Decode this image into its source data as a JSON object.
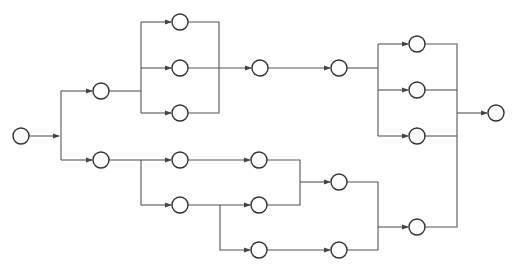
{
  "diagram": {
    "type": "network-flow",
    "colors": {
      "line": "#555555",
      "node_stroke": "#333333",
      "background": "#ffffff"
    },
    "node_radius": 8,
    "nodes": [
      {
        "id": "n0",
        "x": 21,
        "y": 136
      },
      {
        "id": "n1",
        "x": 101,
        "y": 91
      },
      {
        "id": "n2",
        "x": 101,
        "y": 160
      },
      {
        "id": "n3",
        "x": 180,
        "y": 22
      },
      {
        "id": "n4",
        "x": 180,
        "y": 68
      },
      {
        "id": "n5",
        "x": 180,
        "y": 113
      },
      {
        "id": "n6",
        "x": 260,
        "y": 68
      },
      {
        "id": "n7",
        "x": 339,
        "y": 68
      },
      {
        "id": "n8",
        "x": 417,
        "y": 44
      },
      {
        "id": "n9",
        "x": 417,
        "y": 90
      },
      {
        "id": "n10",
        "x": 417,
        "y": 136
      },
      {
        "id": "n11",
        "x": 496,
        "y": 113
      },
      {
        "id": "n12",
        "x": 180,
        "y": 160
      },
      {
        "id": "n13",
        "x": 180,
        "y": 205
      },
      {
        "id": "n14",
        "x": 259,
        "y": 160
      },
      {
        "id": "n15",
        "x": 259,
        "y": 205
      },
      {
        "id": "n16",
        "x": 259,
        "y": 250
      },
      {
        "id": "n17",
        "x": 339,
        "y": 182
      },
      {
        "id": "n18",
        "x": 339,
        "y": 250
      },
      {
        "id": "n19",
        "x": 417,
        "y": 227
      }
    ],
    "edges": [
      {
        "points": [
          [
            29,
            136
          ],
          [
            59,
            136
          ]
        ],
        "arrow": true
      },
      {
        "points": [
          [
            61,
            91
          ],
          [
            61,
            160
          ]
        ],
        "arrow": false
      },
      {
        "points": [
          [
            61,
            91
          ],
          [
            92,
            91
          ]
        ],
        "arrow": true
      },
      {
        "points": [
          [
            61,
            160
          ],
          [
            92,
            160
          ]
        ],
        "arrow": true
      },
      {
        "points": [
          [
            109,
            91
          ],
          [
            141,
            91
          ]
        ],
        "arrow": false
      },
      {
        "points": [
          [
            141,
            22
          ],
          [
            141,
            113
          ]
        ],
        "arrow": false
      },
      {
        "points": [
          [
            141,
            22
          ],
          [
            171,
            22
          ]
        ],
        "arrow": true
      },
      {
        "points": [
          [
            141,
            68
          ],
          [
            171,
            68
          ]
        ],
        "arrow": true
      },
      {
        "points": [
          [
            141,
            113
          ],
          [
            171,
            113
          ]
        ],
        "arrow": true
      },
      {
        "points": [
          [
            188,
            22
          ],
          [
            219,
            22
          ],
          [
            219,
            113
          ],
          [
            188,
            113
          ]
        ],
        "arrow": false
      },
      {
        "points": [
          [
            188,
            68
          ],
          [
            251,
            68
          ]
        ],
        "arrow": true
      },
      {
        "points": [
          [
            268,
            68
          ],
          [
            330,
            68
          ]
        ],
        "arrow": true
      },
      {
        "points": [
          [
            347,
            68
          ],
          [
            378,
            68
          ]
        ],
        "arrow": false
      },
      {
        "points": [
          [
            378,
            44
          ],
          [
            378,
            136
          ]
        ],
        "arrow": false
      },
      {
        "points": [
          [
            378,
            44
          ],
          [
            408,
            44
          ]
        ],
        "arrow": true
      },
      {
        "points": [
          [
            378,
            90
          ],
          [
            408,
            90
          ]
        ],
        "arrow": true
      },
      {
        "points": [
          [
            378,
            136
          ],
          [
            408,
            136
          ]
        ],
        "arrow": true
      },
      {
        "points": [
          [
            425,
            44
          ],
          [
            457,
            44
          ],
          [
            457,
            227
          ],
          [
            425,
            227
          ]
        ],
        "arrow": false
      },
      {
        "points": [
          [
            425,
            90
          ],
          [
            457,
            90
          ]
        ],
        "arrow": false
      },
      {
        "points": [
          [
            425,
            136
          ],
          [
            457,
            136
          ]
        ],
        "arrow": false
      },
      {
        "points": [
          [
            457,
            113
          ],
          [
            487,
            113
          ]
        ],
        "arrow": true
      },
      {
        "points": [
          [
            109,
            160
          ],
          [
            141,
            160
          ]
        ],
        "arrow": false
      },
      {
        "points": [
          [
            141,
            160
          ],
          [
            141,
            205
          ]
        ],
        "arrow": false
      },
      {
        "points": [
          [
            141,
            160
          ],
          [
            171,
            160
          ]
        ],
        "arrow": true
      },
      {
        "points": [
          [
            141,
            205
          ],
          [
            171,
            205
          ]
        ],
        "arrow": true
      },
      {
        "points": [
          [
            188,
            160
          ],
          [
            250,
            160
          ]
        ],
        "arrow": true
      },
      {
        "points": [
          [
            188,
            205
          ],
          [
            250,
            205
          ]
        ],
        "arrow": true
      },
      {
        "points": [
          [
            220,
            205
          ],
          [
            220,
            250
          ],
          [
            250,
            250
          ]
        ],
        "arrow": true
      },
      {
        "points": [
          [
            267,
            160
          ],
          [
            300,
            160
          ],
          [
            300,
            205
          ],
          [
            267,
            205
          ]
        ],
        "arrow": false
      },
      {
        "points": [
          [
            300,
            182
          ],
          [
            330,
            182
          ]
        ],
        "arrow": true
      },
      {
        "points": [
          [
            267,
            250
          ],
          [
            330,
            250
          ]
        ],
        "arrow": true
      },
      {
        "points": [
          [
            347,
            182
          ],
          [
            378,
            182
          ],
          [
            378,
            250
          ],
          [
            347,
            250
          ]
        ],
        "arrow": false
      },
      {
        "points": [
          [
            378,
            227
          ],
          [
            408,
            227
          ]
        ],
        "arrow": true
      }
    ]
  }
}
